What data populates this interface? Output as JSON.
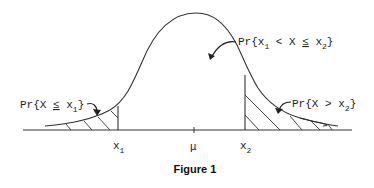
{
  "figure": {
    "caption": "Figure 1",
    "axis": {
      "x1_label": "x",
      "x1_sub": "1",
      "mu_label": "μ",
      "x2_label": "x",
      "x2_sub": "2"
    },
    "annotations": {
      "left_tail": {
        "prefix": "Pr{X ",
        "op": "≤",
        "var": " x",
        "sub": "1",
        "suffix": "}"
      },
      "middle": {
        "prefix": "Pr{x",
        "sub1": "1",
        "mid": " < X ",
        "op": "≤",
        "var": " x",
        "sub2": "2",
        "suffix": "}"
      },
      "right_tail": {
        "prefix": "Pr{X > x",
        "sub": "2",
        "suffix": "}"
      }
    },
    "colors": {
      "line": "#333333",
      "background": "#ffffff"
    }
  }
}
